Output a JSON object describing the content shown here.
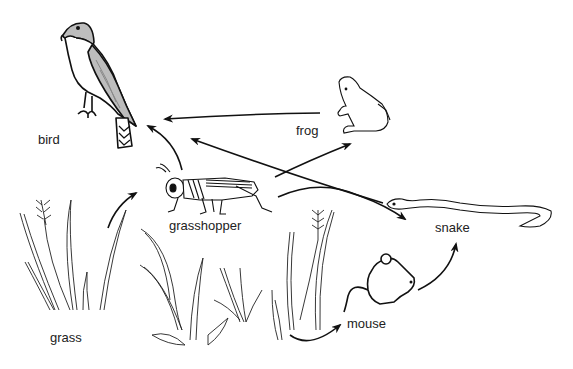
{
  "diagram": {
    "type": "food-web",
    "organisms": [
      {
        "id": "bird",
        "label": "bird",
        "icon": "bird-icon"
      },
      {
        "id": "frog",
        "label": "frog",
        "icon": "frog-icon"
      },
      {
        "id": "grasshopper",
        "label": "grasshopper",
        "icon": "grasshopper-icon"
      },
      {
        "id": "snake",
        "label": "snake",
        "icon": "snake-icon"
      },
      {
        "id": "mouse",
        "label": "mouse",
        "icon": "mouse-icon"
      },
      {
        "id": "grass",
        "label": "grass",
        "icon": "grass-icon"
      }
    ],
    "arrows": [
      {
        "from": "grass",
        "to": "grasshopper"
      },
      {
        "from": "grass",
        "to": "mouse"
      },
      {
        "from": "grasshopper",
        "to": "bird"
      },
      {
        "from": "grasshopper",
        "to": "frog"
      },
      {
        "from": "grasshopper",
        "to": "snake"
      },
      {
        "from": "frog",
        "to": "bird"
      },
      {
        "from": "snake",
        "to": "bird"
      },
      {
        "from": "mouse",
        "to": "snake"
      }
    ],
    "colors": {
      "line": "#111111",
      "bird_wing": "#b8b8b8",
      "background": "#ffffff"
    }
  }
}
